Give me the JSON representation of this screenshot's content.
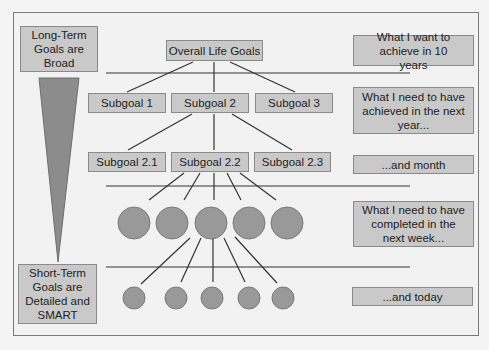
{
  "left_labels": {
    "top": "Long-Term Goals are Broad",
    "bottom": "Short-Term Goals are Detailed and SMART"
  },
  "tree": {
    "root": "Overall Life Goals",
    "level1": [
      "Subgoal 1",
      "Subgoal 2",
      "Subgoal 3"
    ],
    "level2": [
      "Subgoal 2.1",
      "Subgoal 2.2",
      "Subgoal 2.3"
    ],
    "level3_count": 5,
    "level4_count": 5
  },
  "right_labels": [
    "What I want to achieve in 10 years",
    "What I need to have achieved in the next year...",
    "...and month",
    "What I need to have completed in the next week...",
    "...and today"
  ],
  "colors": {
    "box_fill": "#c9c9c9",
    "box_border": "#8a8a8a",
    "circle_fill": "#999999",
    "triangle_fill": "#8c8c8c",
    "line": "#333333",
    "background": "#f2f2f2"
  }
}
